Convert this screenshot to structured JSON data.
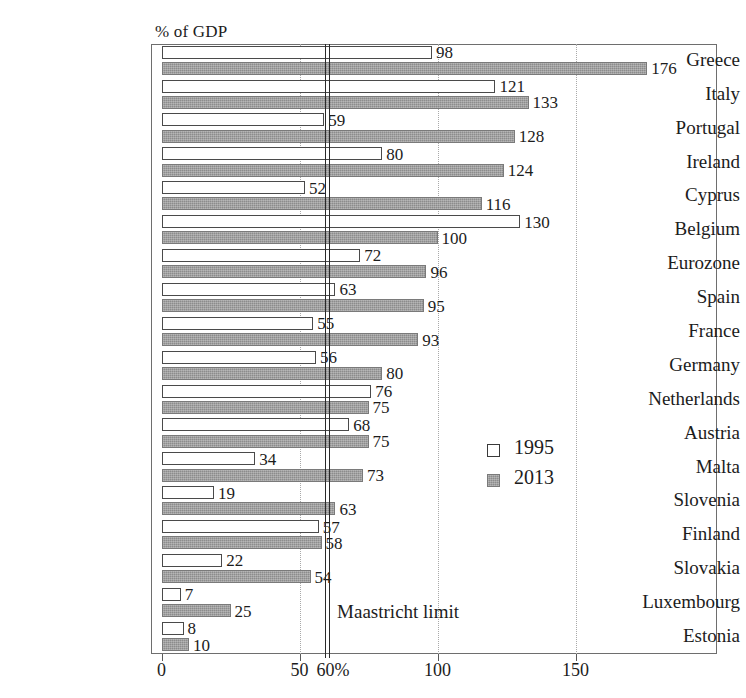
{
  "chart_data": {
    "type": "bar",
    "orientation": "horizontal",
    "title": "",
    "xlabel": "",
    "ylabel": "",
    "axis_title": "% of GDP",
    "xlim": [
      0,
      185
    ],
    "grid": true,
    "gridlines": [
      50,
      100,
      150
    ],
    "xticks": [
      0,
      50,
      100,
      150
    ],
    "xtick_labels": [
      "0",
      "50",
      "100",
      "150"
    ],
    "percent_tick": {
      "value": 60,
      "label": "60%"
    },
    "legend_position": "center-right",
    "categories": [
      "Greece",
      "Italy",
      "Portugal",
      "Ireland",
      "Cyprus",
      "Belgium",
      "Eurozone",
      "Spain",
      "France",
      "Germany",
      "Netherlands",
      "Austria",
      "Malta",
      "Slovenia",
      "Finland",
      "Slovakia",
      "Luxembourg",
      "Estonia"
    ],
    "series": [
      {
        "name": "1995",
        "color": "#ffffff",
        "values": [
          98,
          121,
          59,
          80,
          52,
          130,
          72,
          63,
          55,
          56,
          76,
          68,
          34,
          19,
          57,
          22,
          7,
          8
        ]
      },
      {
        "name": "2013",
        "color": "#8c8c8c",
        "values": [
          176,
          133,
          128,
          124,
          116,
          100,
          96,
          95,
          93,
          80,
          75,
          75,
          73,
          63,
          58,
          54,
          25,
          10
        ]
      }
    ],
    "annotations": [
      {
        "name": "maastricht-limit",
        "label": "Maastricht limit",
        "value": 60
      }
    ]
  },
  "legend": {
    "items": [
      {
        "label": "1995",
        "swatch": "open-square"
      },
      {
        "label": "2013",
        "swatch": "filled-square"
      }
    ]
  }
}
